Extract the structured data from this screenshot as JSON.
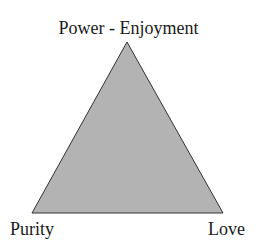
{
  "diagram": {
    "type": "triangle",
    "fill_color": "#b3b3b3",
    "stroke_color": "#333333",
    "vertices": {
      "top": "Power - Enjoyment",
      "bottom_left": "Purity",
      "bottom_right": "Love"
    }
  }
}
